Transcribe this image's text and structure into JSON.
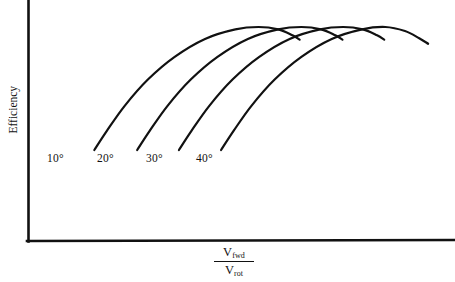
{
  "figure": {
    "background_color": "#ffffff",
    "line_color": "#111111"
  },
  "axes": {
    "y_axis_label": "Efficiency",
    "x_axis_label_numerator_var": "V",
    "x_axis_label_numerator_sub": "fwd",
    "x_axis_label_denominator_var": "V",
    "x_axis_label_denominator_sub": "rot"
  },
  "chart_data": {
    "type": "line",
    "title": "",
    "subtitle": "",
    "xlabel": "V_fwd / V_rot",
    "ylabel": "Efficiency",
    "xlim": [
      0,
      1
    ],
    "ylim": [
      0,
      1
    ],
    "grid": false,
    "ticks": {
      "x": [],
      "y": []
    },
    "legend_position": "inline-curve-labels",
    "annotations": [
      "10°",
      "20°",
      "30°",
      "40°"
    ],
    "series": [
      {
        "name": "10°",
        "label": "10°",
        "color": "#111111",
        "points": [
          {
            "x": 0.085,
            "y": 0.4
          },
          {
            "x": 0.12,
            "y": 0.48
          },
          {
            "x": 0.17,
            "y": 0.585
          },
          {
            "x": 0.235,
            "y": 0.695
          },
          {
            "x": 0.31,
            "y": 0.79
          },
          {
            "x": 0.395,
            "y": 0.865
          },
          {
            "x": 0.48,
            "y": 0.905
          },
          {
            "x": 0.545,
            "y": 0.915
          },
          {
            "x": 0.6,
            "y": 0.905
          },
          {
            "x": 0.64,
            "y": 0.88
          },
          {
            "x": 0.66,
            "y": 0.862
          }
        ]
      },
      {
        "name": "20°",
        "label": "20°",
        "color": "#111111",
        "points": [
          {
            "x": 0.205,
            "y": 0.4
          },
          {
            "x": 0.24,
            "y": 0.48
          },
          {
            "x": 0.29,
            "y": 0.585
          },
          {
            "x": 0.355,
            "y": 0.695
          },
          {
            "x": 0.43,
            "y": 0.79
          },
          {
            "x": 0.515,
            "y": 0.865
          },
          {
            "x": 0.6,
            "y": 0.905
          },
          {
            "x": 0.665,
            "y": 0.915
          },
          {
            "x": 0.72,
            "y": 0.905
          },
          {
            "x": 0.76,
            "y": 0.88
          },
          {
            "x": 0.78,
            "y": 0.862
          }
        ]
      },
      {
        "name": "30°",
        "label": "30°",
        "color": "#111111",
        "points": [
          {
            "x": 0.322,
            "y": 0.4
          },
          {
            "x": 0.357,
            "y": 0.48
          },
          {
            "x": 0.407,
            "y": 0.585
          },
          {
            "x": 0.472,
            "y": 0.695
          },
          {
            "x": 0.547,
            "y": 0.79
          },
          {
            "x": 0.632,
            "y": 0.865
          },
          {
            "x": 0.717,
            "y": 0.905
          },
          {
            "x": 0.782,
            "y": 0.915
          },
          {
            "x": 0.837,
            "y": 0.905
          },
          {
            "x": 0.877,
            "y": 0.88
          },
          {
            "x": 0.897,
            "y": 0.862
          }
        ]
      },
      {
        "name": "40°",
        "label": "40°",
        "color": "#111111",
        "points": [
          {
            "x": 0.44,
            "y": 0.4
          },
          {
            "x": 0.475,
            "y": 0.48
          },
          {
            "x": 0.525,
            "y": 0.585
          },
          {
            "x": 0.59,
            "y": 0.695
          },
          {
            "x": 0.665,
            "y": 0.79
          },
          {
            "x": 0.75,
            "y": 0.865
          },
          {
            "x": 0.835,
            "y": 0.905
          },
          {
            "x": 0.9,
            "y": 0.915
          },
          {
            "x": 0.955,
            "y": 0.898
          },
          {
            "x": 0.995,
            "y": 0.868
          },
          {
            "x": 1.02,
            "y": 0.845
          }
        ]
      }
    ]
  }
}
